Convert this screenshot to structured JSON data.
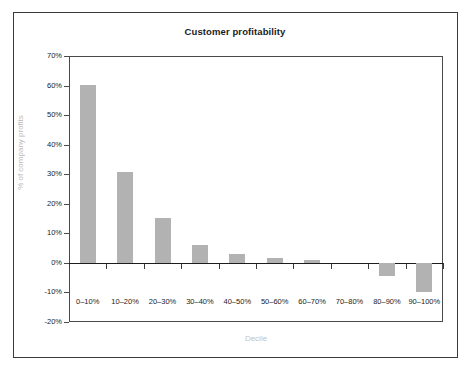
{
  "chart_data": {
    "type": "bar",
    "title": "Customer profitability",
    "xlabel": "Decile",
    "ylabel": "% of company profits",
    "categories": [
      "0–10%",
      "10–20%",
      "20–30%",
      "30–40%",
      "40–50%",
      "50–60%",
      "60–70%",
      "70–80%",
      "80–90%",
      "90–100%"
    ],
    "values": [
      60.3,
      30.6,
      15.1,
      6.0,
      2.9,
      1.6,
      1.0,
      0.0,
      -4.5,
      -10.0
    ],
    "ylim": [
      -20,
      70
    ],
    "ytick_labels": [
      "70%",
      "60%",
      "50%",
      "40%",
      "30%",
      "20%",
      "10%",
      "0%",
      "-10%",
      "-20%"
    ],
    "ytick_values": [
      70,
      60,
      50,
      40,
      30,
      20,
      10,
      0,
      -10,
      -20
    ],
    "grid": false,
    "legend": null,
    "bar_color": "#b2b2b2",
    "axis_color": "#4a4a4a",
    "axis_label_color": "#bdbdbd",
    "title_color": "#1c1c1c"
  }
}
